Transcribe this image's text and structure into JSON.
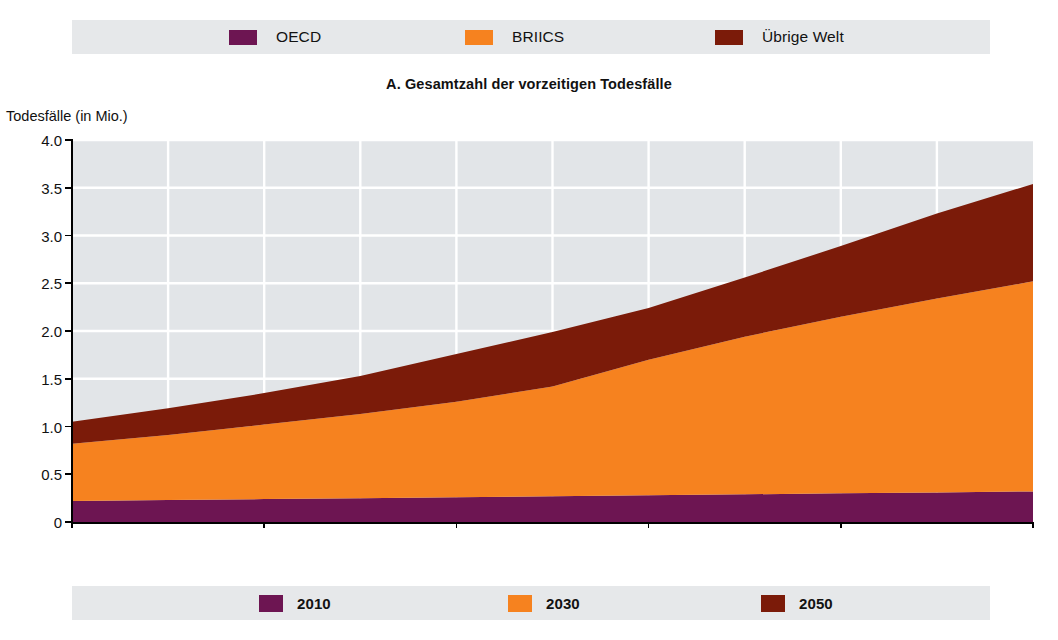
{
  "chart_data": {
    "type": "area",
    "stacked": true,
    "title": "A. Gesamtzahl der vorzeitigen Todesfälle",
    "ylabel": "Todesfälle (in Mio.)",
    "xlabel": "",
    "ylim": [
      0,
      4.0
    ],
    "xlim": [
      2000,
      2050
    ],
    "grid": true,
    "y_ticks": [
      "0",
      "0.5",
      "1.0",
      "1.5",
      "2.0",
      "2.5",
      "3.0",
      "3.5",
      "4.0"
    ],
    "y_tick_values": [
      0,
      0.5,
      1.0,
      1.5,
      2.0,
      2.5,
      3.0,
      3.5,
      4.0
    ],
    "x_ticks": [
      "2000",
      "2010",
      "2020",
      "2030",
      "2040",
      "2050"
    ],
    "x_tick_values": [
      2000,
      2010,
      2020,
      2030,
      2040,
      2050
    ],
    "x": [
      2000,
      2005,
      2010,
      2015,
      2020,
      2025,
      2030,
      2035,
      2040,
      2045,
      2050
    ],
    "series": [
      {
        "name": "OECD",
        "color": "#6d1552",
        "values": [
          0.22,
          0.23,
          0.24,
          0.25,
          0.26,
          0.27,
          0.28,
          0.29,
          0.3,
          0.31,
          0.32
        ]
      },
      {
        "name": "BRIICS",
        "color": "#f6821f",
        "values": [
          0.6,
          0.68,
          0.78,
          0.88,
          1.0,
          1.15,
          1.42,
          1.65,
          1.85,
          2.03,
          2.2
        ]
      },
      {
        "name": "Übrige Welt",
        "color": "#7b1b09",
        "values": [
          0.23,
          0.28,
          0.33,
          0.4,
          0.5,
          0.57,
          0.54,
          0.62,
          0.74,
          0.89,
          1.02
        ]
      }
    ],
    "stacked_totals": [
      1.05,
      1.19,
      1.35,
      1.53,
      1.76,
      1.99,
      2.24,
      2.56,
      2.89,
      3.23,
      3.54
    ],
    "legend_position": "top"
  },
  "legend_top": {
    "items": [
      {
        "label": "OECD",
        "color": "#6d1552",
        "x": 229
      },
      {
        "label": "BRIICS",
        "color": "#f6821f",
        "x": 465
      },
      {
        "label": "Übrige Welt",
        "color": "#7b1b09",
        "x": 715
      }
    ]
  },
  "legend_bottom": {
    "items": [
      {
        "label": "2010",
        "color": "#6d1552",
        "x": 259
      },
      {
        "label": "2030",
        "color": "#f6821f",
        "x": 508
      },
      {
        "label": "2050",
        "color": "#7b1b09",
        "x": 761
      }
    ]
  },
  "colors": {
    "plot_background": "#e2e5e8",
    "legend_band_background": "#e6e8ea",
    "gridline": "#ffffff",
    "axis": "#000000",
    "page_background": "#ffffff"
  }
}
